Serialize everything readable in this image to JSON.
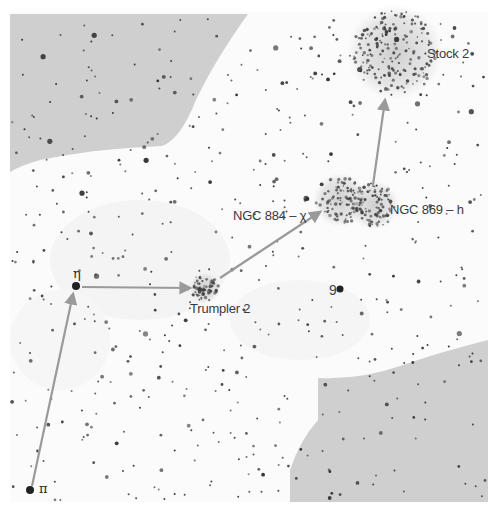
{
  "chart_title": "Double Cluster finder chart (Perseus)",
  "colors": {
    "background": "#fbfbfb",
    "shaded_region": "#cfcfcf",
    "star": "#2b2b2b",
    "arrow": "#9a9a9a",
    "label": "#3a3a3a",
    "cluster_haze": "#d8d8d8"
  },
  "labels": {
    "stock2": "Stock 2",
    "ngc884": "NGC 884 – χ",
    "ngc869": "NGC 869 – h",
    "trumpler2": "Trumpler 2",
    "eta": "η",
    "pi": "π",
    "nine": "9"
  },
  "objects": [
    {
      "id": "stock2",
      "name": "Stock 2",
      "type": "open-cluster",
      "x": 395,
      "y": 52,
      "r": 42
    },
    {
      "id": "ngc884",
      "name": "NGC 884",
      "type": "open-cluster",
      "x": 340,
      "y": 200,
      "r": 24
    },
    {
      "id": "ngc869",
      "name": "NGC 869",
      "type": "open-cluster",
      "x": 374,
      "y": 205,
      "r": 22
    },
    {
      "id": "trumpler2",
      "name": "Trumpler 2",
      "type": "open-cluster",
      "x": 205,
      "y": 288,
      "r": 14
    },
    {
      "id": "eta",
      "name": "η Persei",
      "type": "star",
      "x": 76,
      "y": 286,
      "r": 4
    },
    {
      "id": "pi",
      "name": "π Persei",
      "type": "star",
      "x": 30,
      "y": 490,
      "r": 4
    },
    {
      "id": "nine",
      "name": "9 Persei",
      "type": "star",
      "x": 340,
      "y": 289,
      "r": 3.5
    }
  ],
  "star_hop_arrows": [
    {
      "from": "π",
      "to": "η",
      "x1": 32,
      "y1": 486,
      "x2": 73,
      "y2": 294
    },
    {
      "from": "η",
      "to": "Trumpler 2",
      "x1": 82,
      "y1": 287,
      "x2": 190,
      "y2": 288
    },
    {
      "from": "Trumpler 2",
      "to": "NGC 884",
      "x1": 220,
      "y1": 278,
      "x2": 320,
      "y2": 212
    },
    {
      "from": "NGC 869",
      "to": "Stock 2",
      "x1": 373,
      "y1": 185,
      "x2": 385,
      "y2": 100
    }
  ]
}
